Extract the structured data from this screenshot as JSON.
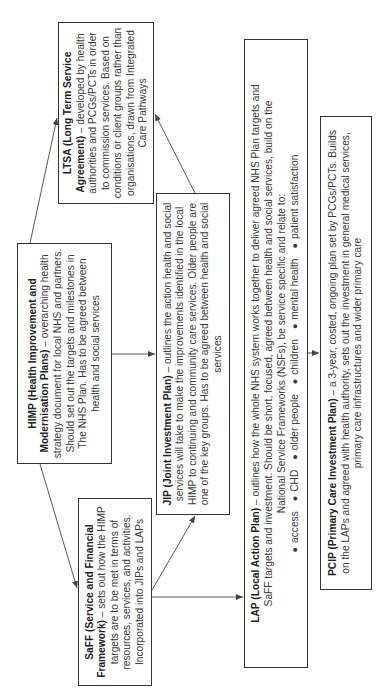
{
  "diagram": {
    "orientation": "rotated 90 degrees counter-clockwise",
    "boxes": {
      "himp": {
        "title": "HIMP (Health Improvement and Modernisation Plans)",
        "body": " – overarching health strategy document for local NHS and partners. Should set out the targets and milestones in The NHS Plan. Has to be agreed between health and social services"
      },
      "ltsa": {
        "title": "LTSA (Long Term Service Agreement)",
        "body": " – developed by health authorities and PCGs/PCTs in order to commission services.  Based on conditions or client groups rather than organisations, drawn from Integrated Care Pathways"
      },
      "saff": {
        "title": "SaFF (Service and Financial Framework)",
        "body": " – sets out how the HIMP targets are to be met in terms of resources, services, and activities. Incorporated into JIPs and LAPs"
      },
      "jip": {
        "title": "JIP (Joint Investment Plan)",
        "body": " – outlines the action health and social services will take to make the improvements identified in the local HIMP to continuing and community care services. Older people are one of the key groups. Has to be agreed between health and social services"
      },
      "lap": {
        "title": "LAP (Local Action Plan)",
        "body": " – outlines how the whole NHS system works together to deliver agreed NHS Plan targets and SaFF targets and investment.  Should be short, focused, agreed between health and social services, build on the National Service Frameworks (NSFs), be service specific and relate to:",
        "bullets": [
          "access",
          "CHD",
          "older people",
          "children",
          "mental health",
          "patient satisfaction"
        ]
      },
      "pcip": {
        "title": "PCIP (Primary Care Investment Plan)",
        "body": " – a 3-year, costed, ongoing plan set by PCGs/PCTs. Builds on the LAPs and agreed with health authority, sets out the investment in general medical services, primary care infrastructures and wider primary care"
      }
    },
    "arrows": [
      {
        "from": "HIMP",
        "to": "LTSA"
      },
      {
        "from": "HIMP",
        "to": "SaFF"
      },
      {
        "from": "HIMP",
        "to": "JIP"
      },
      {
        "from": "JIP",
        "to": "LTSA"
      },
      {
        "from": "SaFF",
        "to": "JIP"
      },
      {
        "from": "SaFF",
        "to": "LAP"
      },
      {
        "from": "LAP",
        "to": "PCIP"
      }
    ],
    "colors": {
      "border": "#333333",
      "text": "#3a3a3a",
      "arrow": "#444444",
      "background": "#ffffff"
    }
  }
}
